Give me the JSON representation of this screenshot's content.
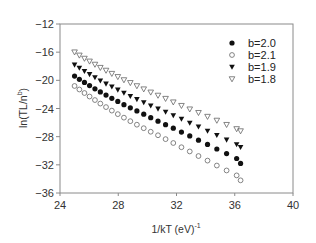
{
  "chart_data": {
    "type": "scatter",
    "title": "",
    "xlabel": "1/kT  (eV)",
    "xlabel_superscript": "-1",
    "ylabel": "ln(TL/n",
    "ylabel_superscript": "b",
    "ylabel_suffix": ")",
    "xlim": [
      24,
      40
    ],
    "ylim": [
      -36,
      -12
    ],
    "xticks": [
      24,
      28,
      32,
      36,
      40
    ],
    "yticks": [
      -12,
      -16,
      -20,
      -24,
      -28,
      -32,
      -36
    ],
    "xtick_labels": [
      "24",
      "28",
      "32",
      "36",
      "40"
    ],
    "ytick_labels": [
      "−12",
      "−16",
      "−20",
      "−24",
      "−28",
      "−32",
      "−36"
    ],
    "grid": false,
    "legend_position": "upper right (inside)",
    "x": [
      25.0,
      25.33,
      25.68,
      26.03,
      26.4,
      26.77,
      27.16,
      27.56,
      27.97,
      28.39,
      28.83,
      29.28,
      29.75,
      30.23,
      30.73,
      31.25,
      31.78,
      32.34,
      32.91,
      33.51,
      34.13,
      34.77,
      35.44,
      36.13,
      36.4
    ],
    "series": [
      {
        "name": "b=2.0",
        "marker": "filled-circle",
        "values": [
          -19.4,
          -19.85,
          -20.3,
          -20.75,
          -21.2,
          -21.65,
          -22.1,
          -22.55,
          -23.0,
          -23.45,
          -23.9,
          -24.35,
          -24.8,
          -25.3,
          -25.8,
          -26.3,
          -26.8,
          -27.35,
          -27.9,
          -28.5,
          -29.1,
          -29.75,
          -30.4,
          -31.1,
          -31.8
        ]
      },
      {
        "name": "b=2.1",
        "marker": "open-circle",
        "values": [
          -20.8,
          -21.3,
          -21.8,
          -22.3,
          -22.8,
          -23.3,
          -23.8,
          -24.3,
          -24.8,
          -25.3,
          -25.8,
          -26.3,
          -26.8,
          -27.3,
          -27.8,
          -28.35,
          -28.9,
          -29.5,
          -30.1,
          -30.75,
          -31.4,
          -32.1,
          -32.8,
          -33.5,
          -34.2
        ]
      },
      {
        "name": "b=1.9",
        "marker": "filled-triangle-down",
        "values": [
          -17.8,
          -18.25,
          -18.7,
          -19.15,
          -19.6,
          -20.05,
          -20.5,
          -20.9,
          -21.35,
          -21.8,
          -22.25,
          -22.7,
          -23.15,
          -23.6,
          -24.05,
          -24.5,
          -25.0,
          -25.5,
          -26.05,
          -26.6,
          -27.2,
          -27.8,
          -28.45,
          -29.1,
          -29.5
        ]
      },
      {
        "name": "b=1.8",
        "marker": "open-triangle-down",
        "values": [
          -16.0,
          -16.45,
          -16.9,
          -17.3,
          -17.75,
          -18.2,
          -18.6,
          -19.05,
          -19.5,
          -19.95,
          -20.35,
          -20.8,
          -21.25,
          -21.7,
          -22.15,
          -22.6,
          -23.1,
          -23.6,
          -24.1,
          -24.6,
          -25.15,
          -25.7,
          -26.3,
          -26.9,
          -27.2
        ]
      }
    ]
  },
  "legend": {
    "items": [
      {
        "label": "b=2.0",
        "marker": "filled-circle"
      },
      {
        "label": "b=2.1",
        "marker": "open-circle"
      },
      {
        "label": "b=1.9",
        "marker": "filled-triangle-down"
      },
      {
        "label": "b=1.8",
        "marker": "open-triangle-down"
      }
    ]
  },
  "colors": {
    "axis": "#8a8a8a",
    "marker": "#111111",
    "text": "#333333",
    "background": "#ffffff"
  }
}
